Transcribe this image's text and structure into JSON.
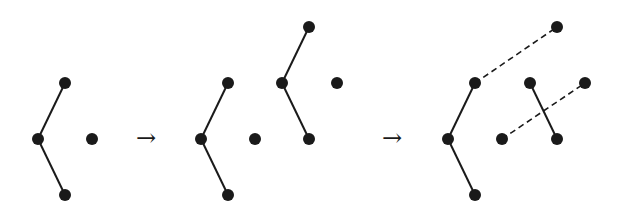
{
  "diagram": {
    "colors": {
      "node": "#1a1a1a",
      "edge": "#1a1a1a",
      "background": "#ffffff"
    },
    "node_radius": 6,
    "arrows": [
      {
        "symbol": "→",
        "x": 146,
        "y": 139
      },
      {
        "symbol": "→",
        "x": 392,
        "y": 139
      }
    ],
    "panels": [
      {
        "name": "stage-1",
        "nodes": [
          [
            65,
            83
          ],
          [
            38,
            139
          ],
          [
            65,
            195
          ],
          [
            92,
            139
          ]
        ],
        "solid_edges": [
          [
            0,
            1
          ],
          [
            1,
            2
          ]
        ],
        "dashed_edges": []
      },
      {
        "name": "stage-2",
        "nodes": [
          [
            228,
            83
          ],
          [
            201,
            139
          ],
          [
            228,
            195
          ],
          [
            255,
            139
          ],
          [
            309,
            27
          ],
          [
            282,
            83
          ],
          [
            309,
            139
          ],
          [
            337,
            83
          ]
        ],
        "solid_edges": [
          [
            0,
            1
          ],
          [
            1,
            2
          ],
          [
            4,
            5
          ],
          [
            5,
            6
          ]
        ],
        "dashed_edges": []
      },
      {
        "name": "stage-3",
        "nodes": [
          [
            475,
            83
          ],
          [
            448,
            139
          ],
          [
            475,
            195
          ],
          [
            502,
            139
          ],
          [
            530,
            83
          ],
          [
            557,
            139
          ],
          [
            557,
            27
          ],
          [
            585,
            83
          ]
        ],
        "solid_edges": [
          [
            0,
            1
          ],
          [
            1,
            2
          ],
          [
            4,
            5
          ]
        ],
        "dashed_edges": [
          [
            0,
            6
          ],
          [
            3,
            7
          ]
        ]
      }
    ]
  }
}
